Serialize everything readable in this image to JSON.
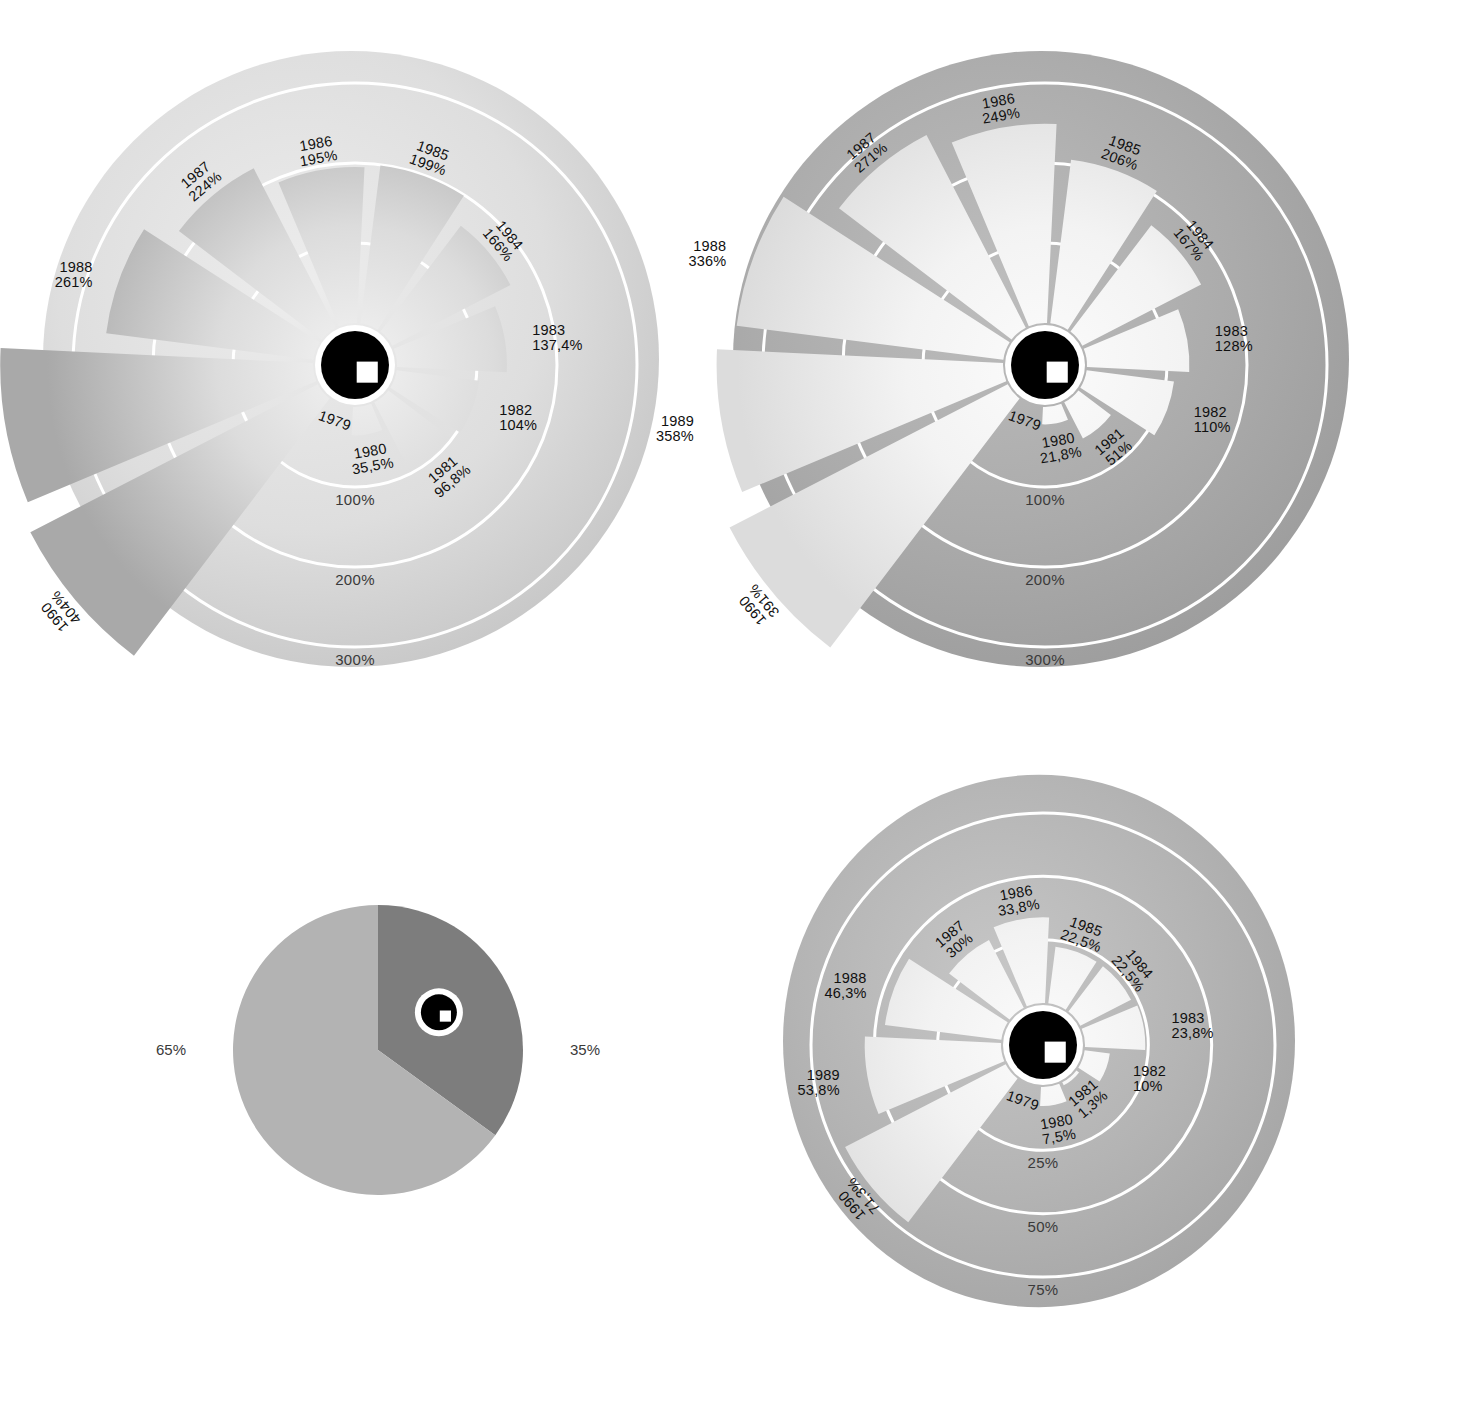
{
  "page": {
    "background_color": "#ffffff",
    "text_color": "#1a1a1a"
  },
  "charts": [
    {
      "id": "chart-top-left",
      "name": "polar-bar-chart-top-left",
      "center": [
        355,
        365
      ],
      "disc_radius": 310,
      "disc_center_offset": [
        -5,
        -5
      ],
      "hub_radius": 38,
      "ring_color": "#ffffff",
      "background_from": "#e8e8e8",
      "background_to": "#c9c9c9",
      "wedge_color_start": "#efefef",
      "wedge_color_end": "#b9b9b9",
      "axis_labels": [
        "100%",
        "200%",
        "300%"
      ],
      "axis_values": [
        100,
        200,
        300
      ]
    },
    {
      "id": "chart-top-right",
      "name": "polar-bar-chart-top-right",
      "center": [
        1045,
        365
      ],
      "disc_radius": 310,
      "hub_radius": 38,
      "axis_labels": [
        "100%",
        "200%",
        "300%"
      ],
      "axis_values": [
        100,
        200,
        300
      ]
    },
    {
      "id": "chart-bottom-left-pie",
      "name": "pie-chart-bottom-left",
      "center": [
        378,
        1050
      ],
      "radius": 145,
      "hub_radius": 19
    },
    {
      "id": "chart-bottom-right",
      "name": "polar-bar-chart-bottom-right",
      "center": [
        1043,
        1045
      ],
      "disc_radius": 255,
      "hub_radius": 38,
      "axis_labels": [
        "25%",
        "50%",
        "75%"
      ],
      "axis_values": [
        25,
        50,
        75
      ]
    }
  ],
  "chart_data": [
    {
      "type": "bar",
      "subtype": "polar-rose",
      "id": "chart-top-left",
      "title": "",
      "xlabel": "",
      "ylabel": "",
      "categories": [
        "1979",
        "1980",
        "1981",
        "1982",
        "1983",
        "1984",
        "1985",
        "1986",
        "1987",
        "1988",
        "1989",
        "1990"
      ],
      "values": [
        0,
        35.5,
        96.8,
        104,
        137.4,
        166,
        199,
        195,
        224,
        261,
        391,
        404
      ],
      "value_labels": [
        "",
        "35,5%",
        "96,8%",
        "104%",
        "137,4%",
        "166%",
        "199%",
        "195%",
        "224%",
        "261%",
        "391%",
        "404%"
      ],
      "point_labels": [
        "1979",
        "1980",
        "1981",
        "1982",
        "1983",
        "1984",
        "1985",
        "1986",
        "1987",
        "1988",
        "1989",
        "1990"
      ],
      "radial_ticks": [
        100,
        200,
        300
      ],
      "radial_tick_labels": [
        "100%",
        "200%",
        "300%"
      ],
      "rlim": [
        0,
        404
      ],
      "grid": true,
      "legend": "none"
    },
    {
      "type": "bar",
      "subtype": "polar-rose",
      "id": "chart-top-right",
      "title": "",
      "xlabel": "",
      "ylabel": "",
      "categories": [
        "1979",
        "1980",
        "1981",
        "1982",
        "1983",
        "1984",
        "1985",
        "1986",
        "1987",
        "1988",
        "1989",
        "1990"
      ],
      "values": [
        0,
        21.8,
        51,
        110,
        128,
        167,
        206,
        249,
        271,
        336,
        358,
        391
      ],
      "value_labels": [
        "",
        "21,8%",
        "51%",
        "110%",
        "128%",
        "167%",
        "206%",
        "249%",
        "271%",
        "336%",
        "358%",
        "391%"
      ],
      "point_labels": [
        "1979",
        "1980",
        "1981",
        "1982",
        "1983",
        "1984",
        "1985",
        "1986",
        "1987",
        "1988",
        "1989",
        "1990"
      ],
      "radial_ticks": [
        100,
        200,
        300
      ],
      "radial_tick_labels": [
        "100%",
        "200%",
        "300%"
      ],
      "rlim": [
        0,
        391
      ],
      "grid": true,
      "legend": "none"
    },
    {
      "type": "pie",
      "id": "chart-bottom-left-pie",
      "title": "",
      "labels": [
        "65%",
        "35%"
      ],
      "values": [
        65,
        35
      ],
      "colors": [
        "#b3b3b3",
        "#7d7d7d"
      ],
      "legend": "outside"
    },
    {
      "type": "bar",
      "subtype": "polar-rose",
      "id": "chart-bottom-right",
      "title": "",
      "xlabel": "",
      "ylabel": "",
      "categories": [
        "1979",
        "1980",
        "1981",
        "1982",
        "1983",
        "1984",
        "1985",
        "1986",
        "1987",
        "1988",
        "1989",
        "1990"
      ],
      "values": [
        0,
        7.5,
        1.3,
        10,
        23.8,
        22.5,
        22.5,
        33.8,
        30,
        46.3,
        53.8,
        71.3
      ],
      "value_labels": [
        "",
        "7,5%",
        "1,3%",
        "10%",
        "23,8%",
        "22,5%",
        "22,5%",
        "33,8%",
        "30%",
        "46,3%",
        "53,8%",
        "71,3%"
      ],
      "point_labels": [
        "1979",
        "1980",
        "1981",
        "1982",
        "1983",
        "1984",
        "1985",
        "1986",
        "1987",
        "1988",
        "1989",
        "1990"
      ],
      "radial_ticks": [
        25,
        50,
        75
      ],
      "radial_tick_labels": [
        "25%",
        "50%",
        "75%"
      ],
      "rlim": [
        0,
        75
      ],
      "grid": true,
      "legend": "none"
    }
  ]
}
